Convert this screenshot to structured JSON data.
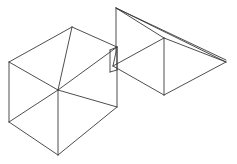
{
  "figure": {
    "background_color": "#ffffff",
    "stroke_color": "#3a3a3a",
    "stroke_width": 0.9,
    "canvas": {
      "width": 237,
      "height": 164
    },
    "objects": [
      {
        "name": "cube",
        "label": "Wireframe cube",
        "type": "hexahedron-wireframe",
        "vertices": {
          "top": [
            72,
            27
          ],
          "left_upper": [
            9,
            62
          ],
          "right_upper": [
            117,
            47
          ],
          "center": [
            58,
            90
          ],
          "left_lower": [
            9,
            122
          ],
          "right_lower": [
            117,
            107
          ],
          "bottom": [
            58,
            155
          ]
        },
        "edges": [
          {
            "name": "top-to-left-upper",
            "from": [
              72,
              27
            ],
            "to": [
              9,
              62
            ]
          },
          {
            "name": "top-to-right-upper",
            "from": [
              72,
              27
            ],
            "to": [
              117,
              47
            ]
          },
          {
            "name": "left-upper-to-center",
            "from": [
              9,
              62
            ],
            "to": [
              58,
              90
            ]
          },
          {
            "name": "right-upper-to-center",
            "from": [
              117,
              47
            ],
            "to": [
              58,
              90
            ]
          },
          {
            "name": "top-to-center-vertical",
            "from": [
              72,
              27
            ],
            "to": [
              58,
              90
            ]
          },
          {
            "name": "left-upper-to-left-lower",
            "from": [
              9,
              62
            ],
            "to": [
              9,
              122
            ]
          },
          {
            "name": "right-upper-to-right-lower",
            "from": [
              117,
              47
            ],
            "to": [
              117,
              107
            ]
          },
          {
            "name": "center-to-bottom-vertical",
            "from": [
              58,
              90
            ],
            "to": [
              58,
              155
            ]
          },
          {
            "name": "left-lower-to-bottom",
            "from": [
              9,
              122
            ],
            "to": [
              58,
              155
            ]
          },
          {
            "name": "right-lower-to-bottom",
            "from": [
              117,
              107
            ],
            "to": [
              58,
              155
            ]
          },
          {
            "name": "left-lower-to-center-hidden",
            "from": [
              9,
              122
            ],
            "to": [
              58,
              90
            ]
          },
          {
            "name": "right-lower-to-center-hidden",
            "from": [
              117,
              107
            ],
            "to": [
              58,
              90
            ]
          }
        ]
      },
      {
        "name": "pyramid",
        "label": "Wireframe pyramid",
        "type": "pyramid-wireframe",
        "vertices": {
          "apex_left": [
            116,
            8
          ],
          "apex_right": [
            226,
            60
          ],
          "base_top": [
            164,
            38
          ],
          "base_left": [
            113,
            66
          ],
          "base_bottom": [
            164,
            95
          ],
          "base_right": [
            226,
            62
          ],
          "column_foot": [
            116,
            52
          ]
        },
        "edges": [
          {
            "name": "apex-left-to-base-top",
            "from": [
              116,
              8
            ],
            "to": [
              164,
              38
            ]
          },
          {
            "name": "apex-left-to-apex-right",
            "from": [
              116,
              8
            ],
            "to": [
              226,
              60
            ]
          },
          {
            "name": "apex-left-to-base-right",
            "from": [
              116,
              8
            ],
            "to": [
              226,
              62
            ]
          },
          {
            "name": "apex-left-column",
            "from": [
              116,
              8
            ],
            "to": [
              116,
              52
            ]
          },
          {
            "name": "column-foot-to-base-left",
            "from": [
              116,
              52
            ],
            "to": [
              113,
              66
            ]
          },
          {
            "name": "base-top-to-base-right",
            "from": [
              164,
              38
            ],
            "to": [
              226,
              62
            ]
          },
          {
            "name": "base-top-to-base-left",
            "from": [
              164,
              38
            ],
            "to": [
              113,
              66
            ]
          },
          {
            "name": "base-top-to-base-bottom",
            "from": [
              164,
              38
            ],
            "to": [
              164,
              95
            ]
          },
          {
            "name": "base-left-to-base-bottom",
            "from": [
              113,
              66
            ],
            "to": [
              164,
              95
            ]
          },
          {
            "name": "base-bottom-to-base-right",
            "from": [
              164,
              95
            ],
            "to": [
              226,
              62
            ]
          }
        ]
      },
      {
        "name": "junction",
        "label": "Overlap seam between cube and pyramid",
        "type": "seam",
        "edges": [
          {
            "name": "seam-left-vertical",
            "from": [
              110,
              50
            ],
            "to": [
              110,
              72
            ]
          },
          {
            "name": "seam-right-vertical",
            "from": [
              117,
              47
            ],
            "to": [
              117,
              70
            ]
          },
          {
            "name": "seam-top",
            "from": [
              110,
              50
            ],
            "to": [
              117,
              47
            ]
          },
          {
            "name": "seam-bottom",
            "from": [
              110,
              72
            ],
            "to": [
              117,
              70
            ]
          }
        ]
      }
    ]
  }
}
